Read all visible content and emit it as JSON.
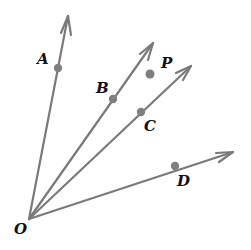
{
  "diagram": {
    "type": "geometry-rays",
    "colors": {
      "ray": "#7a7a7a",
      "point": "#7f7f7f",
      "label": "#111111",
      "background": "#ffffff"
    },
    "vertex": {
      "label": "O",
      "x": 29,
      "y": 219,
      "label_x": 14,
      "label_y": 234
    },
    "rays": [
      {
        "name": "ray-OA",
        "tip": [
          68,
          16
        ],
        "point": {
          "label": "A",
          "x": 58,
          "y": 68,
          "label_x": 37,
          "label_y": 64
        }
      },
      {
        "name": "ray-OB",
        "tip": [
          153,
          43
        ],
        "point": {
          "label": "B",
          "x": 113,
          "y": 99,
          "label_x": 96,
          "label_y": 93
        }
      },
      {
        "name": "ray-OC",
        "tip": [
          191,
          66
        ],
        "point": {
          "label": "C",
          "x": 141,
          "y": 112,
          "label_x": 144,
          "label_y": 131
        }
      },
      {
        "name": "ray-OD",
        "tip": [
          233,
          152
        ],
        "point": {
          "label": "D",
          "x": 175,
          "y": 166,
          "label_x": 177,
          "label_y": 186
        }
      }
    ],
    "free_point": {
      "label": "P",
      "x": 150,
      "y": 74,
      "label_x": 161,
      "label_y": 68
    }
  }
}
